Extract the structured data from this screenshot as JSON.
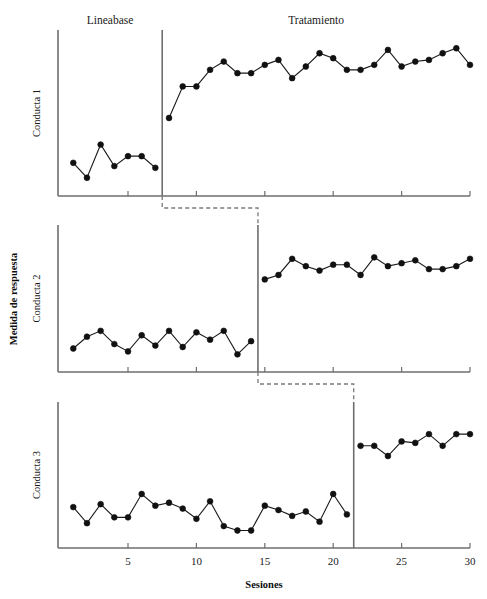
{
  "figure": {
    "width": 487,
    "height": 599,
    "background": "#ffffff",
    "axis_color": "#6e6e6e",
    "line_color": "#1a1a1a",
    "marker_color": "#111111",
    "phase_line_color": "#6e6e6e",
    "connector_color": "#7a7a7a"
  },
  "labels": {
    "phase_baseline": "Lineabase",
    "phase_treatment": "Tratamiento",
    "x_axis_title": "Sesiones",
    "y_axis_title": "Medida de respuesta"
  },
  "axis": {
    "x_ticks": [
      5,
      10,
      15,
      20,
      25,
      30
    ],
    "x_tick_labels": [
      "5",
      "10",
      "15",
      "20",
      "25",
      "30"
    ],
    "x_min": 0.5,
    "x_max": 30.5,
    "grid": false
  },
  "chart_data": {
    "type": "line",
    "title": "",
    "subtitle": "",
    "xlabel": "Sesiones",
    "ylabel": "Medida de respuesta",
    "xlim": [
      0.5,
      30.5
    ],
    "ylim": [
      0,
      100
    ],
    "grid": false,
    "legend": "none",
    "design": "multiple-baseline",
    "panels": [
      {
        "name": "Conducta 1",
        "ylabel": "Conducta 1",
        "intervention_session": 7.5,
        "phase_label_baseline": "Lineabase",
        "phase_label_treatment": "Tratamiento",
        "series": [
          {
            "name": "Lineabase",
            "x": [
              1,
              2,
              3,
              4,
              5,
              6,
              7
            ],
            "values": [
              20,
              11,
              31,
              18,
              24,
              24,
              17
            ]
          },
          {
            "name": "Tratamiento",
            "x": [
              8,
              9,
              10,
              11,
              12,
              13,
              14,
              15,
              16,
              17,
              18,
              19,
              20,
              21,
              22,
              23,
              24,
              25,
              26,
              27,
              28,
              29,
              30
            ],
            "values": [
              47,
              66,
              66,
              76,
              81,
              74,
              74,
              79,
              82,
              71,
              78,
              86,
              83,
              76,
              76,
              79,
              88,
              78,
              81,
              82,
              86,
              89,
              79
            ]
          }
        ]
      },
      {
        "name": "Conducta 2",
        "ylabel": "Conducta 2",
        "intervention_session": 14.5,
        "series": [
          {
            "name": "Lineabase",
            "x": [
              1,
              2,
              3,
              4,
              5,
              6,
              7,
              8,
              9,
              10,
              11,
              12,
              13,
              14
            ],
            "values": [
              16,
              24,
              28,
              19,
              14,
              25,
              18,
              28,
              17,
              27,
              22,
              28,
              12,
              21
            ]
          },
          {
            "name": "Tratamiento",
            "x": [
              15,
              16,
              17,
              18,
              19,
              20,
              21,
              22,
              23,
              24,
              25,
              26,
              27,
              28,
              29,
              30
            ],
            "values": [
              63,
              66,
              77,
              72,
              69,
              73,
              73,
              66,
              78,
              72,
              74,
              76,
              70,
              70,
              72,
              77
            ]
          }
        ]
      },
      {
        "name": "Conducta 3",
        "ylabel": "Conducta 3",
        "intervention_session": 21.5,
        "series": [
          {
            "name": "Lineabase",
            "x": [
              1,
              2,
              3,
              4,
              5,
              6,
              7,
              8,
              9,
              10,
              11,
              12,
              13,
              14,
              15,
              16,
              17,
              18,
              19,
              20,
              21
            ],
            "values": [
              28,
              17,
              30,
              21,
              21,
              37,
              29,
              31,
              27,
              20,
              32,
              15,
              12,
              12,
              29,
              26,
              22,
              25,
              18,
              37,
              23
            ]
          },
          {
            "name": "Tratamiento",
            "x": [
              22,
              23,
              24,
              25,
              26,
              27,
              28,
              29,
              30
            ],
            "values": [
              70,
              70,
              63,
              73,
              72,
              78,
              70,
              78,
              78
            ]
          }
        ]
      }
    ]
  }
}
